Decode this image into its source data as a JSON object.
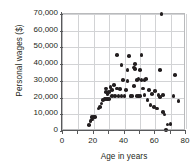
{
  "chart_data": {
    "type": "scatter",
    "title": "",
    "xlabel": "Age in years",
    "ylabel": "Personal wages ($)",
    "xlim": [
      0,
      80
    ],
    "ylim": [
      0,
      70000
    ],
    "xticks": [
      0,
      20,
      40,
      60,
      80
    ],
    "xtick_labels": [
      "0",
      "20",
      "40",
      "60",
      "80"
    ],
    "yticks": [
      0,
      10000,
      20000,
      30000,
      40000,
      50000,
      60000,
      70000
    ],
    "ytick_labels": [
      "0",
      "10,000",
      "20,000",
      "30,000",
      "40,000",
      "50,000",
      "60,000",
      "70,000"
    ],
    "grid": true,
    "legend": null,
    "marker_color": "#231f20",
    "grid_color": "#d2d3d5",
    "axis_color": "#58595b",
    "points": [
      {
        "x": 17,
        "y": 3500
      },
      {
        "x": 18,
        "y": 6000
      },
      {
        "x": 19,
        "y": 7000
      },
      {
        "x": 19,
        "y": 8200
      },
      {
        "x": 20,
        "y": 8200
      },
      {
        "x": 21,
        "y": 8500
      },
      {
        "x": 23,
        "y": 13500
      },
      {
        "x": 24,
        "y": 14500
      },
      {
        "x": 25,
        "y": 16500
      },
      {
        "x": 26,
        "y": 18500
      },
      {
        "x": 27,
        "y": 19200
      },
      {
        "x": 28,
        "y": 19200
      },
      {
        "x": 28,
        "y": 23500
      },
      {
        "x": 28,
        "y": 25500
      },
      {
        "x": 29,
        "y": 19200
      },
      {
        "x": 29,
        "y": 22000
      },
      {
        "x": 29,
        "y": 23000
      },
      {
        "x": 30,
        "y": 19200
      },
      {
        "x": 30,
        "y": 23500
      },
      {
        "x": 31,
        "y": 26500
      },
      {
        "x": 32,
        "y": 21000
      },
      {
        "x": 32,
        "y": 24500
      },
      {
        "x": 33,
        "y": 27500
      },
      {
        "x": 34,
        "y": 21000
      },
      {
        "x": 35,
        "y": 25500
      },
      {
        "x": 35,
        "y": 45500
      },
      {
        "x": 36,
        "y": 21000
      },
      {
        "x": 37,
        "y": 25000
      },
      {
        "x": 38,
        "y": 21000
      },
      {
        "x": 38,
        "y": 39500
      },
      {
        "x": 39,
        "y": 30500
      },
      {
        "x": 40,
        "y": 21000
      },
      {
        "x": 41,
        "y": 24500
      },
      {
        "x": 42,
        "y": 30000
      },
      {
        "x": 42,
        "y": 36500
      },
      {
        "x": 43,
        "y": 45000
      },
      {
        "x": 44,
        "y": 21000
      },
      {
        "x": 45,
        "y": 21000
      },
      {
        "x": 46,
        "y": 27000
      },
      {
        "x": 46,
        "y": 38000
      },
      {
        "x": 47,
        "y": 37000
      },
      {
        "x": 47,
        "y": 40000
      },
      {
        "x": 48,
        "y": 21000
      },
      {
        "x": 48,
        "y": 30500
      },
      {
        "x": 49,
        "y": 21000
      },
      {
        "x": 49,
        "y": 31000
      },
      {
        "x": 50,
        "y": 21000
      },
      {
        "x": 50,
        "y": 36500
      },
      {
        "x": 51,
        "y": 30500
      },
      {
        "x": 51,
        "y": 45500
      },
      {
        "x": 52,
        "y": 25500
      },
      {
        "x": 53,
        "y": 30500
      },
      {
        "x": 53,
        "y": 21500
      },
      {
        "x": 54,
        "y": 31000
      },
      {
        "x": 55,
        "y": 18500
      },
      {
        "x": 56,
        "y": 24500
      },
      {
        "x": 57,
        "y": 15500
      },
      {
        "x": 58,
        "y": 22000
      },
      {
        "x": 59,
        "y": 14500
      },
      {
        "x": 60,
        "y": 24000
      },
      {
        "x": 61,
        "y": 13500
      },
      {
        "x": 62,
        "y": 21500
      },
      {
        "x": 63,
        "y": 20500
      },
      {
        "x": 63,
        "y": 36500
      },
      {
        "x": 64,
        "y": 70000
      },
      {
        "x": 65,
        "y": 21500
      },
      {
        "x": 65,
        "y": 11500
      },
      {
        "x": 66,
        "y": 9800
      },
      {
        "x": 67,
        "y": 500
      },
      {
        "x": 68,
        "y": 4000
      },
      {
        "x": 70,
        "y": 4200
      },
      {
        "x": 72,
        "y": 21000
      },
      {
        "x": 73,
        "y": 33500
      },
      {
        "x": 75,
        "y": 18000
      }
    ]
  }
}
